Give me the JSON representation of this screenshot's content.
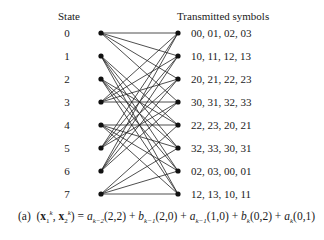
{
  "diagram": {
    "left_header": "State",
    "right_header": "Transmitted symbols",
    "states": [
      "0",
      "1",
      "2",
      "3",
      "4",
      "5",
      "6",
      "7"
    ],
    "symbols": [
      "00, 01, 02, 03",
      "10, 11, 12, 13",
      "20, 21, 22, 23",
      "30, 31, 32, 33",
      "22, 23, 20, 21",
      "32, 33, 30, 31",
      "02, 03, 00, 01",
      "12, 13, 10, 11"
    ],
    "transitions": [
      [
        0,
        1,
        2,
        3
      ],
      [
        4,
        5,
        6,
        7
      ],
      [
        4,
        5,
        6,
        7
      ],
      [
        0,
        1,
        2,
        3
      ],
      [
        4,
        5,
        6,
        7
      ],
      [
        0,
        1,
        2,
        3
      ],
      [
        0,
        1,
        2,
        3
      ],
      [
        4,
        5,
        6,
        7
      ]
    ],
    "line_color": "#222222",
    "node_color": "#111111"
  },
  "caption": {
    "label": "(a)",
    "lhs": "(x",
    "terms": [
      {
        "coef": "a",
        "sub": "k−2",
        "pair": "(2,2)"
      },
      {
        "coef": "b",
        "sub": "k−1",
        "pair": "(2,0)"
      },
      {
        "coef": "a",
        "sub": "k−1",
        "pair": "(1,0)"
      },
      {
        "coef": "b",
        "sub": "k",
        "pair": "(0,2)"
      },
      {
        "coef": "a",
        "sub": "k",
        "pair": "(0,1)"
      }
    ]
  }
}
